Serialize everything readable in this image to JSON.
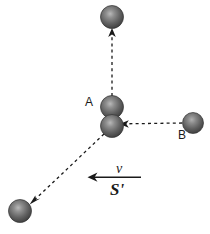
{
  "figure": {
    "background_color": "#ffffff",
    "width": 210,
    "height": 234,
    "labels": {
      "ball_a": "A",
      "ball_b": "B",
      "velocity": "v",
      "frame": "S'"
    },
    "colors": {
      "sphere_dark": "#4a4a4a",
      "sphere_mid": "#6e6e6e",
      "sphere_light": "#a8a8a8",
      "sphere_edge": "#2e2e2e",
      "line": "#1a1a1a",
      "text": "#1a1a1a"
    },
    "spheres": [
      {
        "name": "sphere-top-outgoing",
        "cx": 112,
        "cy": 17,
        "r": 11.5
      },
      {
        "name": "sphere-a-incoming",
        "cx": 112,
        "cy": 107,
        "r": 11.5
      },
      {
        "name": "sphere-collision-center",
        "cx": 112,
        "cy": 126,
        "r": 11.5
      },
      {
        "name": "sphere-b-incoming",
        "cx": 193,
        "cy": 123,
        "r": 10.5
      },
      {
        "name": "sphere-bottom-outgoing",
        "cx": 20,
        "cy": 211,
        "r": 11.5
      }
    ],
    "dashed_arrows": [
      {
        "name": "arrow-a-up",
        "x1": 112,
        "y1": 96,
        "x2": 112,
        "y2": 31,
        "description": "A moves upward after collision"
      },
      {
        "name": "arrow-b-left",
        "x1": 182,
        "y1": 123,
        "x2": 122,
        "y2": 124,
        "description": "B moves leftward toward collision"
      },
      {
        "name": "arrow-diagonal-down-left",
        "x1": 104,
        "y1": 134,
        "x2": 31,
        "y2": 203,
        "description": "outgoing particle moves down-left"
      }
    ],
    "solid_arrow": {
      "name": "velocity-arrow",
      "x1": 141,
      "y1": 177,
      "x2": 90,
      "y2": 177,
      "direction": "left"
    }
  }
}
